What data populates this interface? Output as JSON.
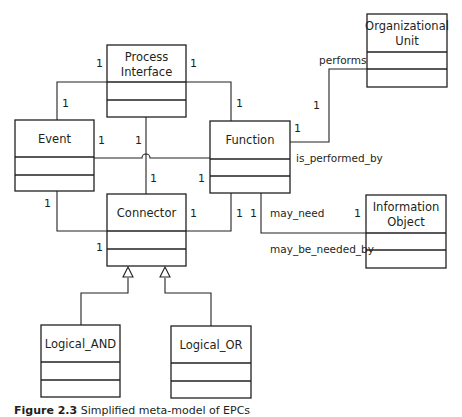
{
  "diagram": {
    "type": "UML class diagram",
    "colors": {
      "line": "#231f20",
      "background": "#ffffff"
    },
    "classes": {
      "process_interface": {
        "line1": "Process",
        "line2": "Interface"
      },
      "organizational_unit": {
        "line1": "Organizational",
        "line2": "Unit"
      },
      "event": {
        "line1": "Event"
      },
      "function": {
        "line1": "Function"
      },
      "connector": {
        "line1": "Connector"
      },
      "information_object": {
        "line1": "Information",
        "line2": "Object"
      },
      "logical_and": {
        "line1": "Logical_AND"
      },
      "logical_or": {
        "line1": "Logical_OR"
      }
    },
    "associations": [
      {
        "from": "Process Interface",
        "to": "Event",
        "from_mult": "1",
        "to_mult": "1"
      },
      {
        "from": "Process Interface",
        "to": "Function",
        "from_mult": "1",
        "to_mult": "1"
      },
      {
        "from": "Process Interface",
        "to": "Connector",
        "from_mult": "1",
        "to_mult": "1"
      },
      {
        "from": "Event",
        "to": "Function",
        "from_mult": "1",
        "to_mult": "1"
      },
      {
        "from": "Event",
        "to": "Connector",
        "from_mult": "1",
        "to_mult": "1"
      },
      {
        "from": "Function",
        "to": "Connector",
        "from_mult": "1",
        "to_mult": "1"
      },
      {
        "from": "Function",
        "to": "Organizational Unit",
        "from_mult": "1",
        "to_mult": "1",
        "role_from": "is_performed_by",
        "role_to": "performs"
      },
      {
        "from": "Function",
        "to": "Information Object",
        "from_mult": "1",
        "to_mult": "1",
        "role_from": "may_be_needed_by",
        "role_to": "may_need"
      }
    ],
    "generalizations": [
      {
        "child": "Logical_AND",
        "parent": "Connector"
      },
      {
        "child": "Logical_OR",
        "parent": "Connector"
      }
    ],
    "labels": {
      "performs": "performs",
      "is_performed_by": "is_performed_by",
      "may_need": "may_need",
      "may_be_needed_by": "may_be_needed_by",
      "one": "1"
    }
  },
  "caption": {
    "figure": "Figure 2.3",
    "text": "Simplified meta-model of EPCs"
  }
}
